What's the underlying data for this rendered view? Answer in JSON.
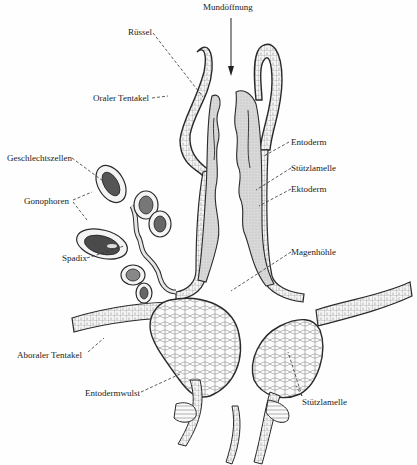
{
  "figure": {
    "labels": {
      "mundoeffnung": "Mundöffnung",
      "ruessel": "Rüssel",
      "oraler_tentakel": "Oraler Tentakel",
      "geschlechtszellen": "Geschlechtszellen",
      "gonophoren": "Gonophoren",
      "spadix": "Spadix",
      "entoderm": "Entoderm",
      "stuetzlamelle_top": "Stützlamelle",
      "ektoderm": "Ektoderm",
      "magenhoehle": "Magenhöhle",
      "aboraler_tentakel": "Aboraler Tentakel",
      "entodermwulst": "Entodermwulst",
      "stuetzlamelle_bottom": "Stützlamelle"
    },
    "colors": {
      "ink": "#2a2a2a",
      "entoderm_fill": "#d4d4d4",
      "cell_fill": "#f2f2f2",
      "gonad_dark": "#555555"
    }
  }
}
